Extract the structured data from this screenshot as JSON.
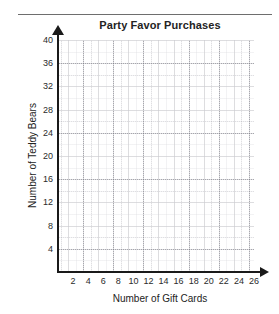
{
  "chart_data": {
    "type": "scatter",
    "title": "Party Favor Purchases",
    "xlabel": "Number of Gift Cards",
    "ylabel": "Number of Teddy Bears",
    "xlim": [
      0,
      26
    ],
    "ylim": [
      0,
      40
    ],
    "x_ticks": [
      "2",
      "4",
      "6",
      "8",
      "10",
      "12",
      "14",
      "16",
      "18",
      "20",
      "22",
      "24",
      "26"
    ],
    "y_ticks": [
      "4",
      "8",
      "12",
      "16",
      "20",
      "24",
      "28",
      "32",
      "36",
      "40"
    ],
    "x_tick_step": 2,
    "y_tick_step": 4,
    "x_minor_step": 1,
    "y_minor_step": 2,
    "grid": true,
    "grid_style": "dotted",
    "legend": "none",
    "series": [
      {
        "name": "Party favor purchases",
        "x": [],
        "y": []
      }
    ],
    "annotations": [],
    "colors": {
      "axis": "#1a1a1a",
      "grid": "#969aa4",
      "text": "#232323",
      "background": "#ffffff",
      "rule": "#6e6e6e"
    }
  }
}
